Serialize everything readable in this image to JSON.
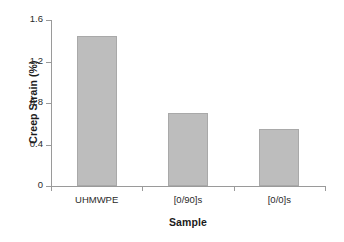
{
  "chart_data": {
    "type": "bar",
    "title": "",
    "xlabel": "Sample",
    "ylabel": "Creep Strain (%)",
    "categories": [
      "UHMWPE",
      "[0/90]s",
      "[0/0]s"
    ],
    "values": [
      1.45,
      0.7,
      0.55
    ],
    "ylim": [
      0,
      1.6
    ],
    "yticks": [
      "0",
      "0.4",
      "0.8",
      "1.2",
      "1.6"
    ],
    "ytick_values": [
      0,
      0.4,
      0.8,
      1.2,
      1.6
    ],
    "grid": false,
    "legend": "none",
    "bar_color": "#bdbdbd",
    "bar_edge_color": "#a9a9a9",
    "axis_color": "#9a9a9a",
    "background_color": "#ffffff"
  }
}
